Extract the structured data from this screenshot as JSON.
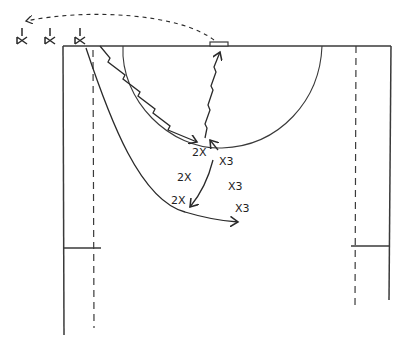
{
  "diagram": {
    "type": "basketball-play-halfcourt",
    "colors": {
      "ink": "#2a2a2a",
      "paper": "#ffffff"
    },
    "players": [
      {
        "id": "bench-1",
        "label": "",
        "x": 20,
        "y": 40,
        "role": "sideline-player"
      },
      {
        "id": "bench-2",
        "label": "",
        "x": 50,
        "y": 40,
        "role": "sideline-player"
      },
      {
        "id": "bench-3",
        "label": "",
        "x": 80,
        "y": 40,
        "role": "sideline-player"
      },
      {
        "id": "x2-a",
        "label": "2",
        "x": 205,
        "y": 152
      },
      {
        "id": "x2-b",
        "label": "2",
        "x": 185,
        "y": 177
      },
      {
        "id": "x2-c",
        "label": "2",
        "x": 180,
        "y": 200
      },
      {
        "id": "x3-a",
        "label": "3",
        "x": 224,
        "y": 161
      },
      {
        "id": "x3-b",
        "label": "3",
        "x": 233,
        "y": 186
      },
      {
        "id": "x3-c",
        "label": "3",
        "x": 240,
        "y": 208
      }
    ],
    "labels": {
      "x2a": "2X",
      "x2b": "2X",
      "x2c": "2X",
      "x3a": "X3",
      "x3b": "X3",
      "x3c": "X3"
    }
  }
}
